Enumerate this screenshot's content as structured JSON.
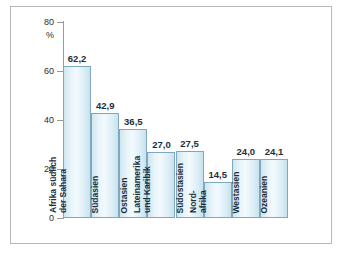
{
  "chart_data": {
    "type": "bar",
    "title": "",
    "xlabel": "",
    "ylabel": "%",
    "ylim": [
      0,
      80
    ],
    "yticks": [
      0,
      20,
      40,
      60,
      80
    ],
    "grid": false,
    "legend": "none",
    "unit_label": "%",
    "categories": [
      "Afrika südlich der Sahara",
      "Südasien",
      "Ostasien",
      "Lateinamerika und Karibik",
      "Südostasien",
      "Nordafrika",
      "Westasien",
      "Ozeanien"
    ],
    "values": [
      62.2,
      42.9,
      36.5,
      27.0,
      27.5,
      14.5,
      24.0,
      24.1
    ],
    "value_labels": [
      "62,2",
      "42,9",
      "36,5",
      "27,0",
      "27,5",
      "14,5",
      "24,0",
      "24,1"
    ],
    "bars": [
      {
        "label_lines": [
          "Afrika südlich",
          "der Sahara"
        ],
        "value_label": "62,2",
        "value": 62.2
      },
      {
        "label_lines": [
          "Südasien"
        ],
        "value_label": "42,9",
        "value": 42.9
      },
      {
        "label_lines": [
          "Ostasien"
        ],
        "value_label": "36,5",
        "value": 36.5
      },
      {
        "label_lines": [
          "Lateinamerika",
          "und Karibik"
        ],
        "value_label": "27,0",
        "value": 27.0
      },
      {
        "label_lines": [
          "Südostasien"
        ],
        "value_label": "27,5",
        "value": 27.5
      },
      {
        "label_lines": [
          "Nord-",
          "afrika"
        ],
        "value_label": "14,5",
        "value": 14.5
      },
      {
        "label_lines": [
          "Westasien"
        ],
        "value_label": "24,0",
        "value": 24.0
      },
      {
        "label_lines": [
          "Ozeanien"
        ],
        "value_label": "24,1",
        "value": 24.1
      }
    ],
    "colors": {
      "bar_fill": "#e3f2f8",
      "bar_border": "#7da8bd",
      "axis": "#9a9a9a",
      "frame": "#b9b9b9",
      "text": "#1c2e3c",
      "background": "#ffffff"
    }
  },
  "y_axis": {
    "ticks": [
      "80",
      "60",
      "40",
      "20",
      "0"
    ],
    "unit": "%"
  }
}
